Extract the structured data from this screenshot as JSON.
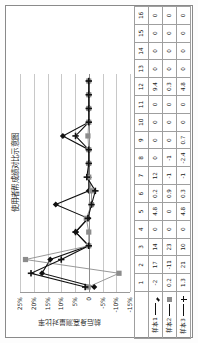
{
  "chart_data": {
    "type": "line",
    "title": "使用者帮成绩对比示意图",
    "xlabel": "",
    "ylabel": "前后身高测量对比率",
    "categories": [
      "1",
      "2",
      "3",
      "4",
      "5",
      "6",
      "7",
      "8",
      "9",
      "10",
      "11",
      "12",
      "13",
      "14",
      "15",
      "16"
    ],
    "ylim": [
      -15,
      25
    ],
    "ytick_labels": [
      "25%",
      "20%",
      "15%",
      "10%",
      "5%",
      "0",
      "-5%",
      "-10%",
      "-15%"
    ],
    "ytick_values": [
      25,
      20,
      15,
      10,
      5,
      0,
      -5,
      -10,
      -15
    ],
    "grid": true,
    "legend_position": "table-left",
    "series": [
      {
        "name": "样本1",
        "marker": "diamond",
        "color": "#111111",
        "values": [
          -2,
          17,
          14,
          0,
          4.8,
          0.2,
          12,
          0,
          0,
          0,
          0,
          9.4,
          0,
          0,
          0,
          0
        ]
      },
      {
        "name": "样本2",
        "marker": "square",
        "color": "#8c8c8c",
        "values": [
          0.2,
          -11,
          23,
          0,
          0,
          0.9,
          -1,
          -1,
          0,
          0,
          0,
          0.3,
          0,
          0,
          0,
          0
        ]
      },
      {
        "name": "样本3",
        "marker": "cross",
        "color": "#111111",
        "values": [
          1.3,
          21,
          10,
          0,
          4.8,
          0.3,
          -1,
          -2.4,
          0.7,
          0,
          0,
          4.8,
          0,
          0,
          0,
          0
        ]
      }
    ]
  },
  "table": {
    "header_row": [
      "",
      "1",
      "2",
      "3",
      "4",
      "5",
      "6",
      "7",
      "8",
      "9",
      "10",
      "11",
      "12",
      "13",
      "14",
      "15",
      "16"
    ],
    "rows": [
      {
        "label": "样本1",
        "marker": "diamond",
        "cells": [
          "-2",
          "17",
          "14",
          "0",
          "4.8",
          "0.2",
          "12",
          "0",
          "0",
          "0",
          "0",
          "9.4",
          "0",
          "0",
          "0",
          "0"
        ]
      },
      {
        "label": "样本2",
        "marker": "square",
        "cells": [
          "0.2",
          "-11",
          "23",
          "0",
          "0",
          "0.9",
          "-1",
          "-1",
          "0",
          "0",
          "0",
          "0.3",
          "0",
          "0",
          "0",
          "0"
        ]
      },
      {
        "label": "样本3",
        "marker": "cross",
        "cells": [
          "1.3",
          "21",
          "10",
          "0",
          "4.8",
          "0.3",
          "-1",
          "-2.4",
          "0.7",
          "0",
          "0",
          "4.8",
          "0",
          "0",
          "0",
          "0"
        ]
      }
    ]
  },
  "colors": {
    "series1": "#111111",
    "series2": "#8c8c8c",
    "series3": "#111111",
    "grid": "#c8c8c8",
    "axis": "#777777",
    "border": "#8a8a8a"
  }
}
